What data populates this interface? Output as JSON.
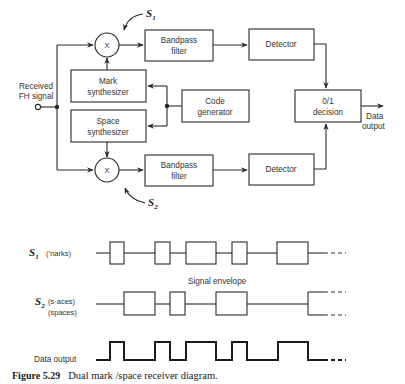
{
  "diagram": {
    "input_label_line1": "Received",
    "input_label_line2": "FH signal",
    "mixer_symbol": "X",
    "s1_label": "S",
    "s1_sub": "1",
    "s2_label": "S",
    "s2_sub": "2",
    "blocks": {
      "bpf_top_line1": "Bandpass",
      "bpf_top_line2": "filter",
      "bpf_bottom_line1": "Bandpass",
      "bpf_bottom_line2": "filter",
      "det_top": "Detector",
      "det_bottom": "Detector",
      "mark_synth_line1": "Mark",
      "mark_synth_line2": "synthesizer",
      "space_synth_line1": "Space",
      "space_synth_line2": "synthesizer",
      "code_gen_line1": "Code",
      "code_gen_line2": "generator",
      "decision_line1": "0/1",
      "decision_line2": "decision"
    },
    "output_label_line1": "Data",
    "output_label_line2": "output"
  },
  "timing": {
    "s1_label": "S",
    "s1_sub": "1",
    "s1_desc": "(’narks)",
    "s2_label": "S",
    "s2_sub": "2",
    "s2_desc_line1": "(s·aces)",
    "s2_desc_line2": "(spaces)",
    "envelope_label": "Signal envelope",
    "data_output_label": "Data output",
    "pulses": {
      "s1_marks": [
        [
          110,
          124
        ],
        [
          155,
          170
        ],
        [
          186,
          214
        ],
        [
          232,
          247
        ],
        [
          279,
          309
        ]
      ],
      "s2_spaces": [
        [
          124,
          155
        ],
        [
          170,
          185
        ],
        [
          214,
          245
        ],
        [
          280,
          297
        ],
        [
          309,
          310
        ]
      ],
      "data_output": [
        [
          110,
          124
        ],
        [
          155,
          170
        ],
        [
          186,
          214
        ],
        [
          232,
          247
        ],
        [
          279,
          309
        ]
      ]
    }
  },
  "caption": {
    "figure_number": "Figure 5.29",
    "text": "Dual mark /space receiver diagram."
  }
}
